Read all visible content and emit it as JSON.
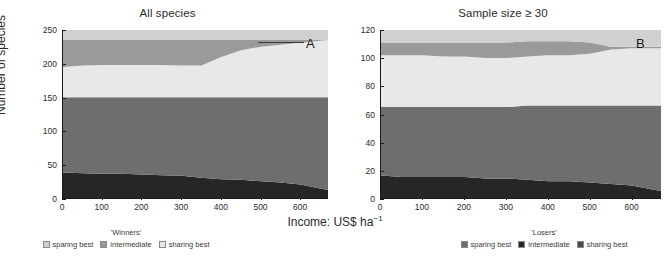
{
  "figure": {
    "axis_x_title_main": "Income: US$ ha",
    "axis_x_title_exp": "−1",
    "axis_y_title": "Number of species"
  },
  "panels": [
    {
      "id": "A",
      "letter": "A",
      "title": "All species",
      "y_ticks": [
        "0",
        "50",
        "100",
        "150",
        "200",
        "250"
      ],
      "x_ticks": [
        "0",
        "100",
        "200",
        "300",
        "400",
        "500",
        "600"
      ],
      "legend": {
        "title": "'Winners'",
        "items": [
          {
            "label": "sparing best",
            "color": "#d0d0d0"
          },
          {
            "label": "intermediate",
            "color": "#9a9a9a"
          },
          {
            "label": "sharing best",
            "color": "#e8e8e8"
          }
        ]
      }
    },
    {
      "id": "B",
      "letter": "B",
      "title": "Sample size ≥ 30",
      "y_ticks": [
        "0",
        "20",
        "40",
        "60",
        "80",
        "100",
        "120"
      ],
      "x_ticks": [
        "0",
        "100",
        "200",
        "300",
        "400",
        "500",
        "600"
      ],
      "legend": {
        "title": "'Losers'",
        "items": [
          {
            "label": "sparing best",
            "color": "#6e6e6e"
          },
          {
            "label": "intermediate",
            "color": "#262626"
          },
          {
            "label": "sharing best",
            "color": "#4a4a4a"
          }
        ]
      }
    }
  ],
  "chart_data": [
    {
      "type": "area",
      "panel": "A",
      "title": "All species",
      "xlabel": "Income: US$ ha^-1",
      "ylabel": "Number of species",
      "xlim": [
        0,
        670
      ],
      "ylim": [
        0,
        250
      ],
      "grid": false,
      "legend_position": "below-left",
      "stacking": "stacked-from-bottom",
      "x": [
        0,
        50,
        100,
        150,
        200,
        250,
        300,
        350,
        400,
        450,
        500,
        550,
        600,
        650,
        670
      ],
      "series": [
        {
          "name": "losers intermediate",
          "group": "Losers",
          "color": "#262626",
          "values": [
            38,
            37,
            36,
            36,
            35,
            34,
            33,
            30,
            28,
            27,
            25,
            23,
            20,
            14,
            12
          ]
        },
        {
          "name": "losers sparing best",
          "group": "Losers",
          "color": "#6e6e6e",
          "values": [
            112,
            113,
            114,
            114,
            115,
            116,
            117,
            120,
            122,
            123,
            125,
            127,
            130,
            136,
            138
          ]
        },
        {
          "name": "winners sharing best",
          "group": "Winners",
          "color": "#e8e8e8",
          "values": [
            45,
            47,
            48,
            48,
            48,
            48,
            47,
            47,
            60,
            70,
            75,
            78,
            81,
            84,
            85
          ]
        },
        {
          "name": "winners intermediate",
          "group": "Winners",
          "color": "#9a9a9a",
          "values": [
            41,
            38,
            37,
            37,
            37,
            37,
            38,
            38,
            26,
            16,
            11,
            8,
            5,
            2,
            1
          ]
        },
        {
          "name": "winners sparing best",
          "group": "Winners",
          "color": "#d0d0d0",
          "values": [
            14,
            15,
            15,
            15,
            15,
            15,
            15,
            15,
            14,
            14,
            14,
            14,
            14,
            14,
            14
          ]
        }
      ],
      "notes": "Stacked areas total 250 species across the full income range."
    },
    {
      "type": "area",
      "panel": "B",
      "title": "Sample size ≥ 30",
      "xlabel": "Income: US$ ha^-1",
      "ylabel": "Number of species",
      "xlim": [
        0,
        670
      ],
      "ylim": [
        0,
        120
      ],
      "grid": false,
      "legend_position": "below-right",
      "stacking": "stacked-from-bottom",
      "x": [
        0,
        50,
        100,
        150,
        200,
        250,
        300,
        350,
        400,
        450,
        500,
        550,
        600,
        650,
        670
      ],
      "series": [
        {
          "name": "losers intermediate",
          "group": "Losers",
          "color": "#262626",
          "values": [
            16,
            15,
            15,
            15,
            15,
            14,
            14,
            13,
            12,
            12,
            11,
            10,
            9,
            6,
            5
          ]
        },
        {
          "name": "losers sparing best",
          "group": "Losers",
          "color": "#6e6e6e",
          "values": [
            49,
            50,
            50,
            50,
            50,
            51,
            51,
            53,
            54,
            54,
            55,
            56,
            57,
            60,
            61
          ]
        },
        {
          "name": "winners sharing best",
          "group": "Winners",
          "color": "#e8e8e8",
          "values": [
            37,
            37,
            37,
            36,
            36,
            35,
            35,
            35,
            36,
            36,
            37,
            40,
            41,
            41,
            41
          ]
        },
        {
          "name": "winners intermediate",
          "group": "Winners",
          "color": "#9a9a9a",
          "values": [
            9,
            9,
            9,
            10,
            10,
            11,
            11,
            11,
            10,
            10,
            8,
            2,
            1,
            1,
            1
          ]
        },
        {
          "name": "winners sparing best",
          "group": "Winners",
          "color": "#d0d0d0",
          "values": [
            9,
            9,
            9,
            9,
            9,
            9,
            9,
            8,
            8,
            8,
            9,
            12,
            12,
            12,
            12
          ]
        }
      ],
      "notes": "Stacked areas total 120 species across the full income range."
    }
  ]
}
